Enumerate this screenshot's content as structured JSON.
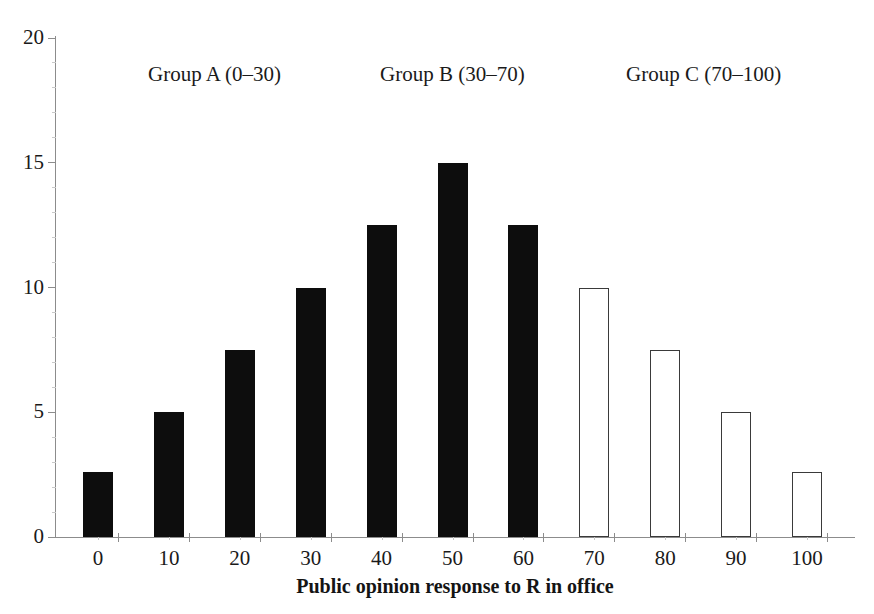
{
  "chart_data": {
    "type": "bar",
    "title": "",
    "xlabel": "Public opinion response to R in office",
    "ylabel": "",
    "categories": [
      "0",
      "10",
      "20",
      "30",
      "40",
      "50",
      "60",
      "70",
      "80",
      "90",
      "100"
    ],
    "values": [
      2.6,
      5.0,
      7.5,
      10.0,
      12.5,
      15.0,
      12.5,
      10.0,
      7.5,
      5.0,
      2.6
    ],
    "bar_styles": [
      "filled",
      "filled",
      "filled",
      "filled",
      "filled",
      "filled",
      "filled",
      "hollow",
      "hollow",
      "hollow",
      "hollow"
    ],
    "xlim": [
      -5,
      105
    ],
    "ylim": [
      0,
      20
    ],
    "ytick_labels": [
      "0",
      "5",
      "10",
      "15",
      "20"
    ],
    "ytick_values": [
      0,
      5,
      10,
      15,
      20
    ],
    "xtick_labels": [
      "0",
      "10",
      "20",
      "30",
      "40",
      "50",
      "60",
      "70",
      "80",
      "90",
      "100"
    ],
    "grid": false,
    "legend": "none",
    "annotations": [
      {
        "text": "Group A (0–30)",
        "x_center": 0.245,
        "y_top": 62
      },
      {
        "text": "Group B (30–70)",
        "x_center": 0.518,
        "y_top": 62
      },
      {
        "text": "Group C (70–100)",
        "x_center": 0.805,
        "y_top": 62
      }
    ],
    "colors": {
      "bar_filled": "#0d0d0d",
      "bar_hollow_fill": "#ffffff",
      "bar_hollow_stroke": "#3a3a3a",
      "axis": "#8c8c8c",
      "text": "#1a1a1a",
      "background": "#ffffff"
    }
  }
}
